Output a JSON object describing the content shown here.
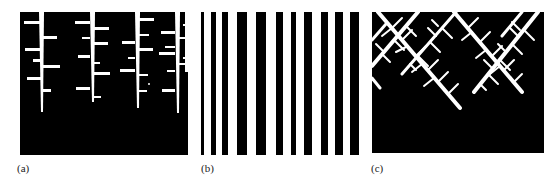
{
  "figure": {
    "panels": [
      {
        "id": "a",
        "label": "(a)",
        "description": "vertical dendritic stems with side branches on black background"
      },
      {
        "id": "b",
        "label": "(b)",
        "description": "vertical black and white stripes of varying width"
      },
      {
        "id": "c",
        "label": "(c)",
        "description": "diagonal crossing dendritic branches on black background"
      }
    ]
  },
  "colors": {
    "background": "#000000",
    "foreground": "#ffffff",
    "page": "#ffffff",
    "label_text": "#222222"
  }
}
